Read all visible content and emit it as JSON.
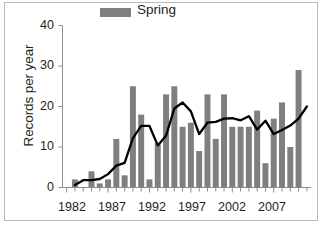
{
  "chart_data": {
    "type": "bar",
    "title": "",
    "xlabel": "",
    "ylabel": "Records per year",
    "ylim": [
      0,
      40
    ],
    "yticks": [
      0,
      10,
      20,
      30,
      40
    ],
    "xticks": [
      1982,
      1987,
      1992,
      1997,
      2002,
      2007
    ],
    "xlim": [
      1981.5,
      2011.5
    ],
    "grid": false,
    "legend": {
      "position": "top-center",
      "entries": [
        {
          "label": "Spring",
          "color": "#7f7f7f",
          "marker": "bar"
        }
      ]
    },
    "categories": [
      1983,
      1984,
      1985,
      1986,
      1987,
      1988,
      1989,
      1990,
      1991,
      1992,
      1993,
      1994,
      1995,
      1996,
      1997,
      1998,
      1999,
      2000,
      2001,
      2002,
      2003,
      2004,
      2005,
      2006,
      2007,
      2008,
      2009,
      2010,
      2011
    ],
    "series": [
      {
        "name": "Spring",
        "type": "bar",
        "color": "#7f7f7f",
        "values": [
          2,
          0,
          4,
          1,
          2,
          12,
          3,
          25,
          18,
          2,
          11,
          23,
          25,
          15,
          16,
          9,
          23,
          12,
          23,
          15,
          15,
          15,
          19,
          6,
          17,
          21,
          10,
          29,
          0
        ]
      },
      {
        "name": "Trend line",
        "type": "line",
        "color": "#000000",
        "values": [
          0.6,
          1.8,
          1.8,
          2.1,
          3.3,
          5.4,
          6.1,
          12.2,
          15.2,
          15.2,
          10.4,
          12.8,
          19.5,
          21.0,
          18.8,
          13.2,
          16.0,
          16.2,
          17.0,
          17.1,
          16.6,
          17.6,
          14.3,
          16.5,
          13.2,
          14.2,
          15.3,
          17.0,
          20.0
        ]
      }
    ],
    "axis_color": "#8c8c8c",
    "tick_color": "#8c8c8c",
    "bar_color": "#7f7f7f",
    "line_color": "#000000",
    "background": "#ffffff"
  },
  "legend": {
    "spring_label": "Spring"
  },
  "axes": {
    "y_title": "Records per year",
    "y_tick_labels": [
      "40",
      "30",
      "20",
      "10",
      "0"
    ],
    "x_tick_labels": [
      "1982",
      "1987",
      "1992",
      "1997",
      "2002",
      "2007"
    ]
  }
}
